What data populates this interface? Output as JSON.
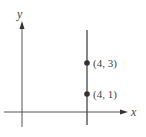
{
  "diagram": {
    "type": "coordinate-plane",
    "axes": {
      "x_label": "x",
      "y_label": "y"
    },
    "vertical_line": {
      "equation": "x = 4"
    },
    "points": [
      {
        "label": "(4, 3)",
        "x": 4,
        "y": 3
      },
      {
        "label": "(4, 1)",
        "x": 4,
        "y": 1
      }
    ],
    "colors": {
      "axis": "#555555",
      "line": "#444444",
      "point": "#333333"
    }
  }
}
